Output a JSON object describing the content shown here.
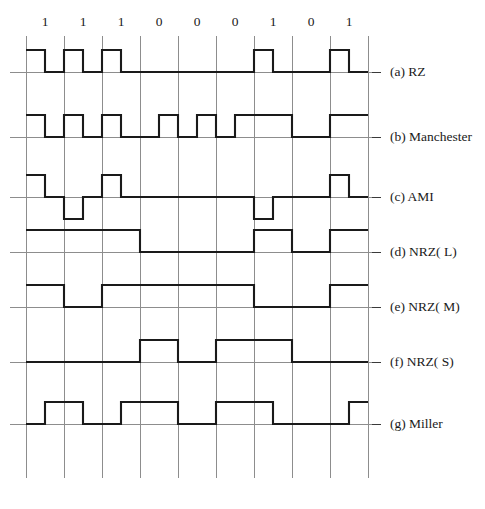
{
  "figure": {
    "bit_sequence": [
      1,
      1,
      1,
      0,
      0,
      0,
      1,
      0,
      1
    ],
    "bit_labels": [
      "1",
      "1",
      "1",
      "0",
      "0",
      "0",
      "1",
      "0",
      "1"
    ],
    "colors": {
      "waveform": "#1a1a1a",
      "grid": "#8d8d8d",
      "background": "#ffffff",
      "text": "#1a1a1a"
    }
  },
  "geometry": {
    "grid_x_start": 26,
    "bit_width": 38,
    "bit_count": 9,
    "grid_top": 36,
    "grid_bottom": 478,
    "label_x": 390,
    "bit_label_y": 26,
    "amplitude": 22,
    "tick_end_x": 381
  },
  "rows": [
    {
      "key": "rz",
      "label": "(a) RZ",
      "baseline_y": 72,
      "levels_per_half_bit": [
        1,
        0,
        1,
        0,
        1,
        0,
        0,
        0,
        0,
        0,
        0,
        0,
        1,
        0,
        0,
        0,
        1,
        0
      ]
    },
    {
      "key": "manchester",
      "label": "(b) Manchester",
      "baseline_y": 137,
      "levels_per_half_bit": [
        1,
        0,
        1,
        0,
        1,
        0,
        0,
        1,
        0,
        1,
        0,
        1,
        1,
        1,
        0,
        0,
        1,
        1
      ]
    },
    {
      "key": "ami",
      "label": "(c) AMI",
      "baseline_y": 197,
      "levels_per_half_bit": [
        1,
        0,
        -1,
        0,
        1,
        0,
        0,
        0,
        0,
        0,
        0,
        0,
        -1,
        0,
        0,
        0,
        1,
        0
      ]
    },
    {
      "key": "nrz_l",
      "label": "(d) NRZ( L)",
      "baseline_y": 252,
      "levels_per_half_bit": [
        1,
        1,
        1,
        1,
        1,
        1,
        0,
        0,
        0,
        0,
        0,
        0,
        1,
        1,
        0,
        0,
        1,
        1
      ]
    },
    {
      "key": "nrz_m",
      "label": "(e) NRZ( M)",
      "baseline_y": 307,
      "levels_per_half_bit": [
        1,
        1,
        0,
        0,
        1,
        1,
        1,
        1,
        1,
        1,
        1,
        1,
        0,
        0,
        0,
        0,
        1,
        1
      ]
    },
    {
      "key": "nrz_s",
      "label": "(f) NRZ( S)",
      "baseline_y": 362,
      "levels_per_half_bit": [
        0,
        0,
        0,
        0,
        0,
        0,
        1,
        1,
        0,
        0,
        1,
        1,
        1,
        1,
        0,
        0,
        0,
        0
      ]
    },
    {
      "key": "miller",
      "label": "(g) Miller",
      "baseline_y": 424,
      "levels_per_half_bit": [
        0,
        1,
        1,
        0,
        0,
        1,
        1,
        1,
        0,
        0,
        1,
        1,
        1,
        0,
        0,
        0,
        0,
        1
      ]
    }
  ]
}
